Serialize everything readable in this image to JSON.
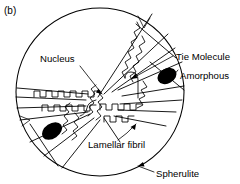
{
  "figure": {
    "panel_label": "(b)",
    "background_color": "#ffffff",
    "ink_color": "#000000"
  },
  "labels": {
    "nucleus": "Nucleus",
    "tie_molecule": "Tie Molecule",
    "amorphous": "Amorphous",
    "lamellar_fibril": "Lamellar fibril",
    "spherulite": "Spherulite"
  },
  "annotations": [
    {
      "id": "nucleus",
      "text": "Nucleus",
      "x": 40,
      "y": 62,
      "anchor": "start",
      "leader": "M 80 66 L 102 94",
      "arrow": true
    },
    {
      "id": "tie-molecule",
      "text": "Tie Molecule",
      "x": 176,
      "y": 60,
      "anchor": "start",
      "leader": "M 173 56 L 131 79",
      "arrow": true
    },
    {
      "id": "amorphous",
      "text": "Amorphous",
      "x": 180,
      "y": 79,
      "anchor": "start",
      "leader": "M 178 70 L 173 76",
      "arrow": false
    },
    {
      "id": "lamellar-fibril",
      "text": "Lamellar fibril",
      "x": 88,
      "y": 148,
      "anchor": "start",
      "leader": "M 118 140 Q 127 134 136 124",
      "arrow": true
    },
    {
      "id": "spherulite",
      "text": "Spherulite",
      "x": 156,
      "y": 177,
      "anchor": "start",
      "leader": "M 154 172 L 138 166",
      "arrow": true
    }
  ],
  "geometry": {
    "circle": {
      "cx": 100,
      "cy": 92,
      "r": 84
    },
    "nucleus_center": {
      "x": 98,
      "y": 98
    },
    "amorphous_regions": [
      {
        "id": "amorphous-right",
        "cx": 167,
        "cy": 76,
        "rx": 10,
        "ry": 7.5,
        "rotate": -28
      },
      {
        "id": "amorphous-left",
        "cx": 52,
        "cy": 131,
        "rx": 11,
        "ry": 7.5,
        "rotate": -34
      }
    ]
  },
  "elements": {
    "spherulite_boundary": "outer circular envelope",
    "lamellar_fibrils": "radiating wavy chain-folded ribbons",
    "wedge_sectors": "straight radial sector boundaries from nucleus",
    "tie_molecule_loop": "hairpin loop bridging adjacent lamellae"
  }
}
